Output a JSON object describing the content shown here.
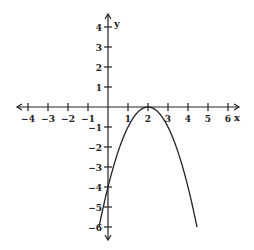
{
  "chart_data": {
    "type": "line",
    "title": "",
    "xlabel": "x",
    "ylabel": "y",
    "xlim": [
      -4.5,
      6.5
    ],
    "ylim": [
      -6.5,
      4.5
    ],
    "grid": false,
    "x_ticks": [
      -4,
      -3,
      -2,
      -1,
      1,
      2,
      3,
      4,
      5,
      6
    ],
    "y_ticks": [
      4,
      3,
      2,
      1,
      -1,
      -2,
      -3,
      -4,
      -5,
      -6
    ],
    "x_tick_labels": [
      "-4",
      "-3",
      "-2",
      "-1",
      "1",
      "2",
      "3",
      "4",
      "5",
      "6"
    ],
    "y_tick_labels": [
      "4",
      "3",
      "2",
      "1",
      "-1",
      "-2",
      "-3",
      "-4",
      "-5",
      "-6"
    ],
    "series": [
      {
        "name": "y = -(x - 2)^2",
        "x": [
          -0.45,
          0,
          0.5,
          1,
          1.5,
          2,
          2.5,
          3,
          3.5,
          4,
          4.45
        ],
        "y": [
          -6,
          -4,
          -2.25,
          -1,
          -0.25,
          0,
          -0.25,
          -1,
          -2.25,
          -4,
          -6
        ]
      }
    ],
    "vertex": [
      2,
      0
    ],
    "y_intercept": -4,
    "legend": null
  },
  "labels": {
    "x_axis": "x",
    "y_axis": "y"
  }
}
